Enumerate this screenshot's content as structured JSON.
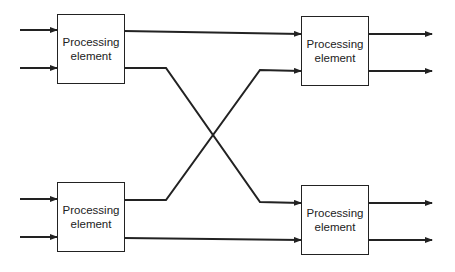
{
  "diagram": {
    "title": "",
    "elements": [
      {
        "id": "pe1",
        "label_line1": "Processing",
        "label_line2": "element"
      },
      {
        "id": "pe2",
        "label_line1": "Processing",
        "label_line2": "element"
      },
      {
        "id": "pe3",
        "label_line1": "Processing",
        "label_line2": "element"
      },
      {
        "id": "pe4",
        "label_line1": "Processing",
        "label_line2": "element"
      }
    ],
    "connections": [
      {
        "from": "input",
        "to": "pe1",
        "count": 2
      },
      {
        "from": "input",
        "to": "pe3",
        "count": 2
      },
      {
        "from": "pe1",
        "to": "pe2",
        "type": "straight"
      },
      {
        "from": "pe1",
        "to": "pe4",
        "type": "crossing"
      },
      {
        "from": "pe3",
        "to": "pe2",
        "type": "crossing"
      },
      {
        "from": "pe3",
        "to": "pe4",
        "type": "straight"
      },
      {
        "from": "pe2",
        "to": "output",
        "count": 2
      },
      {
        "from": "pe4",
        "to": "output",
        "count": 2
      }
    ],
    "colors": {
      "stroke": "#222222",
      "background": "#ffffff"
    }
  }
}
